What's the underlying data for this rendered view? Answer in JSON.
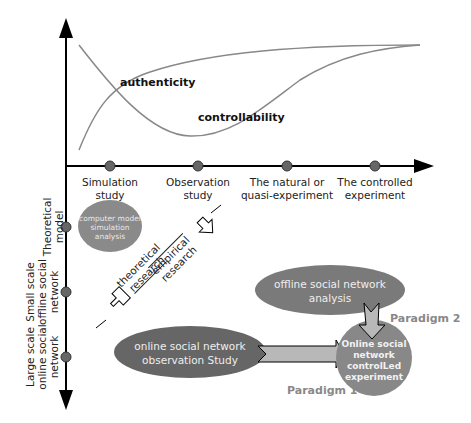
{
  "colors": {
    "axis": "#000000",
    "curve": "#888888",
    "dot": "#666666",
    "ellipse_light": "#8a8a8a",
    "ellipse_dark": "#666666",
    "ellipse_mid": "#7a7a7a",
    "paradigm_text": "#888888",
    "arrow_fill": "#b8b8b8"
  },
  "curves": {
    "authenticity": "authenticity",
    "controllability": "controllability"
  },
  "x_axis": {
    "points": [
      {
        "line1": "Simulation",
        "line2": "study"
      },
      {
        "line1": "Observation",
        "line2": "study"
      },
      {
        "line1": "The natural or",
        "line2": "quasi-experiment"
      },
      {
        "line1": "The controlled",
        "line2": "experiment"
      }
    ]
  },
  "y_axis": {
    "points": [
      {
        "line1": "Theoretical",
        "line2": "model"
      },
      {
        "line1": "Small scale",
        "line2": "offline social",
        "line3": "network"
      },
      {
        "line1": "Large scale",
        "line2": "online social",
        "line3": "network"
      }
    ]
  },
  "diagonal": {
    "theoretical_line1": "theoretical",
    "theoretical_line2": "research",
    "empirical_line1": "empirical",
    "empirical_line2": "research"
  },
  "nodes": {
    "simulation": {
      "line1": "computer model",
      "line2": "simulation",
      "line3": "analysis"
    },
    "offline": {
      "line1": "offline social network",
      "line2": "analysis"
    },
    "online_observation": {
      "line1": "online social network",
      "line2": "observation Study"
    },
    "controlled": {
      "line1": "Online social",
      "line2": "network",
      "line3": "controlLed",
      "line4": "experiment"
    }
  },
  "paradigms": {
    "p1": "Paradigm 1",
    "p2": "Paradigm 2"
  }
}
